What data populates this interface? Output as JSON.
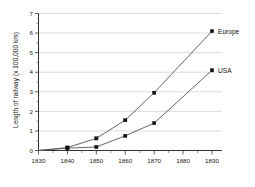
{
  "chart_data": {
    "type": "line",
    "title": "",
    "xlabel": "",
    "ylabel": "Length of railway (x 100,000 km)",
    "x": [
      1830,
      1840,
      1850,
      1860,
      1870,
      1880,
      1890
    ],
    "xlim": [
      1830,
      1890
    ],
    "ylim": [
      0,
      7
    ],
    "ytick_labels": [
      "0",
      "1",
      "2",
      "3",
      "4",
      "5",
      "6",
      "7"
    ],
    "yticks": [
      0,
      1,
      2,
      3,
      4,
      5,
      6,
      7
    ],
    "xtick_labels": [
      "1830",
      "1840",
      "1850",
      "1860",
      "1870",
      "1880",
      "1890"
    ],
    "grid": "horizontal",
    "legend_position": "right-of-line-ends",
    "marker": "square",
    "series": [
      {
        "name": "Europe",
        "label": "Europe",
        "x": [
          1830,
          1840,
          1850,
          1860,
          1870,
          1890
        ],
        "values": [
          0.0,
          0.15,
          0.62,
          1.55,
          2.95,
          6.1
        ]
      },
      {
        "name": "USA",
        "label": "USA",
        "x": [
          1830,
          1840,
          1850,
          1860,
          1870,
          1890
        ],
        "values": [
          0.0,
          0.12,
          0.18,
          0.75,
          1.4,
          4.1
        ]
      }
    ],
    "colors": {
      "line": "#555555",
      "marker": "#111111",
      "grid": "#b8b8b8",
      "axis": "#333333",
      "background": "#ffffff"
    }
  }
}
